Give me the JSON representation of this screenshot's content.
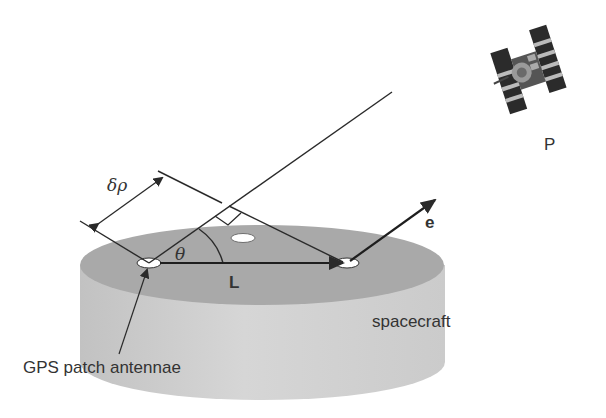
{
  "figure": {
    "type": "GPS attitude determination geometry",
    "labels": {
      "satellite": "P",
      "delta_rho": "δρ",
      "theta": "θ",
      "baseline": "L",
      "unit_vector": "e",
      "body": "spacecraft",
      "antennae": "GPS patch antennae"
    },
    "colors": {
      "line": "#2a2a2a",
      "cylinder_top": "#a9a9a9",
      "cylinder_side": "#cfcfcf",
      "text": "#333333"
    }
  }
}
